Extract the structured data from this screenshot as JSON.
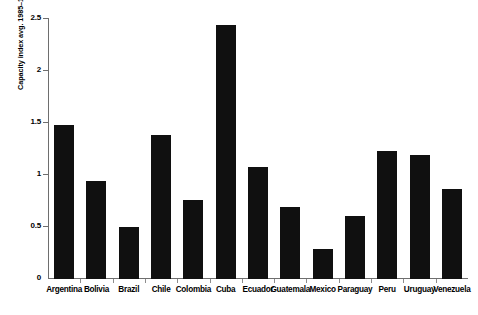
{
  "chart_data": {
    "type": "bar",
    "title": "",
    "subtitle": "",
    "xlabel": "",
    "ylabel": "Capacity index avg. 1985–1995",
    "ylim": [
      0,
      2.5
    ],
    "yticks": [
      "0",
      "0.5",
      "1",
      "1.5",
      "2",
      "2.5"
    ],
    "ytick_values": [
      0,
      0.5,
      1,
      1.5,
      2,
      2.5
    ],
    "grid": false,
    "legend": "none",
    "bar_color": "#101010",
    "axis_color": "#6e6e6e",
    "background_color": "#ffffff",
    "categories": [
      "Argentina",
      "Bolivia",
      "Brazil",
      "Chile",
      "Colombia",
      "Cuba",
      "Ecuador",
      "Guatemala",
      "Mexico",
      "Paraguay",
      "Peru",
      "Uruguay",
      "Venezuela"
    ],
    "values": [
      1.48,
      0.94,
      0.5,
      1.38,
      0.76,
      2.44,
      1.08,
      0.69,
      0.29,
      0.61,
      1.23,
      1.19,
      0.87
    ]
  }
}
